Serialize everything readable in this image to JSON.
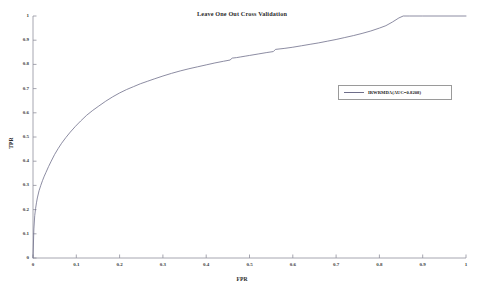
{
  "chart_data": {
    "type": "line",
    "title": "Leave One Out Cross Validation",
    "xlabel": "FPR",
    "ylabel": "TPR",
    "xlim": [
      0,
      1
    ],
    "ylim": [
      0,
      1
    ],
    "grid": false,
    "legend_position": "upper-right",
    "xticks": [
      "0",
      "0.1",
      "0.2",
      "0.3",
      "0.4",
      "0.5",
      "0.6",
      "0.7",
      "0.8",
      "0.9",
      "1"
    ],
    "xtick_values": [
      0,
      0.1,
      0.2,
      0.3,
      0.4,
      0.5,
      0.6,
      0.7,
      0.8,
      0.9,
      1
    ],
    "yticks": [
      "0",
      "0.1",
      "0.2",
      "0.3",
      "0.4",
      "0.5",
      "0.6",
      "0.7",
      "0.8",
      "0.9",
      "1"
    ],
    "ytick_values": [
      0,
      0.1,
      0.2,
      0.3,
      0.4,
      0.5,
      0.6,
      0.7,
      0.8,
      0.9,
      1
    ],
    "series": [
      {
        "name": "IRWRMDA(AUC=0.8208)",
        "auc": 0.8208,
        "color": "#6e6e8a",
        "x": [
          0.0,
          0.002,
          0.004,
          0.006,
          0.008,
          0.01,
          0.014,
          0.018,
          0.022,
          0.026,
          0.03,
          0.036,
          0.042,
          0.05,
          0.058,
          0.066,
          0.076,
          0.086,
          0.098,
          0.11,
          0.124,
          0.138,
          0.152,
          0.168,
          0.184,
          0.2,
          0.216,
          0.232,
          0.248,
          0.264,
          0.28,
          0.3,
          0.32,
          0.34,
          0.36,
          0.38,
          0.4,
          0.42,
          0.44,
          0.455,
          0.46,
          0.47,
          0.48,
          0.49,
          0.5,
          0.52,
          0.54,
          0.555,
          0.56,
          0.58,
          0.6,
          0.62,
          0.64,
          0.66,
          0.68,
          0.7,
          0.72,
          0.74,
          0.76,
          0.78,
          0.8,
          0.815,
          0.83,
          0.845,
          0.855,
          0.87,
          0.9,
          0.94,
          0.97,
          1.0
        ],
        "y": [
          0.0,
          0.12,
          0.175,
          0.205,
          0.228,
          0.248,
          0.278,
          0.3,
          0.32,
          0.338,
          0.354,
          0.378,
          0.4,
          0.428,
          0.452,
          0.474,
          0.498,
          0.52,
          0.544,
          0.566,
          0.59,
          0.61,
          0.628,
          0.648,
          0.666,
          0.682,
          0.696,
          0.708,
          0.72,
          0.73,
          0.74,
          0.752,
          0.763,
          0.773,
          0.782,
          0.79,
          0.798,
          0.806,
          0.813,
          0.818,
          0.826,
          0.828,
          0.831,
          0.834,
          0.837,
          0.843,
          0.849,
          0.853,
          0.862,
          0.866,
          0.871,
          0.877,
          0.883,
          0.889,
          0.896,
          0.903,
          0.911,
          0.919,
          0.928,
          0.938,
          0.95,
          0.96,
          0.975,
          0.992,
          1.0,
          1.0,
          1.0,
          1.0,
          1.0,
          1.0
        ]
      }
    ]
  },
  "legend": {
    "entries": [
      {
        "label": "IRWRMDA(AUC=0.8208)"
      }
    ]
  }
}
